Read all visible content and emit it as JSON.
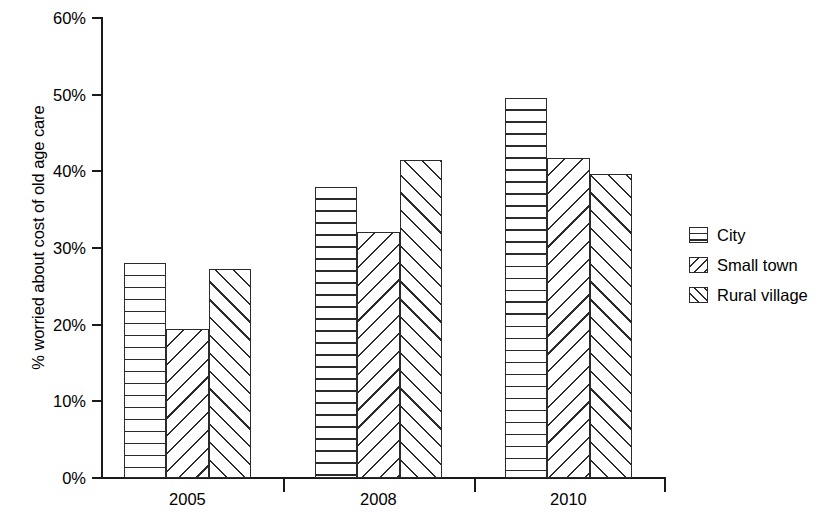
{
  "chart_data": {
    "type": "bar",
    "title": "",
    "xlabel": "",
    "ylabel": "% worried about cost of old age care",
    "categories": [
      "2005",
      "2008",
      "2010"
    ],
    "series": [
      {
        "name": "City",
        "pattern": "horizontal",
        "values": [
          28.1,
          38.0,
          49.6
        ]
      },
      {
        "name": "Small town",
        "pattern": "backslash",
        "values": [
          19.4,
          32.1,
          41.7
        ]
      },
      {
        "name": "Rural village",
        "pattern": "slash",
        "values": [
          27.3,
          41.5,
          39.6
        ]
      }
    ],
    "ylim": [
      0,
      60
    ],
    "ytick_values": [
      0,
      10,
      20,
      30,
      40,
      50,
      60
    ],
    "ytick_labels": [
      "0%",
      "10%",
      "20%",
      "30%",
      "40%",
      "50%",
      "60%"
    ],
    "grid": false,
    "legend_position": "right",
    "colors": {
      "ink": "#2b2b2b",
      "axis": "#1a1a1a",
      "background": "#ffffff"
    }
  }
}
